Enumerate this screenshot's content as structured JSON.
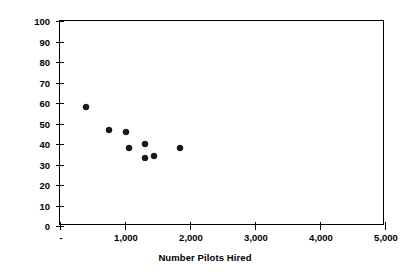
{
  "chart_data": {
    "type": "scatter",
    "title": "",
    "xlabel": "Number Pilots Hired",
    "ylabel": "Percent Military Background",
    "xlim": [
      0,
      5000
    ],
    "ylim": [
      0,
      100
    ],
    "grid": false,
    "legend": false,
    "x_tick_values": [
      0,
      1000,
      2000,
      3000,
      4000,
      5000
    ],
    "x_tick_labels": [
      "-",
      "1,000",
      "2,000",
      "3,000",
      "4,000",
      "5,000"
    ],
    "y_tick_values": [
      0,
      10,
      20,
      30,
      40,
      50,
      60,
      70,
      80,
      90,
      100
    ],
    "y_tick_labels": [
      "0",
      "10",
      "20",
      "30",
      "40",
      "50",
      "60",
      "70",
      "80",
      "90",
      "100"
    ],
    "marker_shape": "diamond",
    "marker_color": "#1a1a1a",
    "points": [
      {
        "x": 400,
        "y": 58
      },
      {
        "x": 760,
        "y": 47
      },
      {
        "x": 1020,
        "y": 46
      },
      {
        "x": 1060,
        "y": 38
      },
      {
        "x": 1310,
        "y": 40
      },
      {
        "x": 1310,
        "y": 33
      },
      {
        "x": 1450,
        "y": 34
      },
      {
        "x": 1850,
        "y": 38
      }
    ]
  },
  "axes": {
    "x_title": "Number Pilots Hired",
    "y_title": "Percent Military Background"
  }
}
